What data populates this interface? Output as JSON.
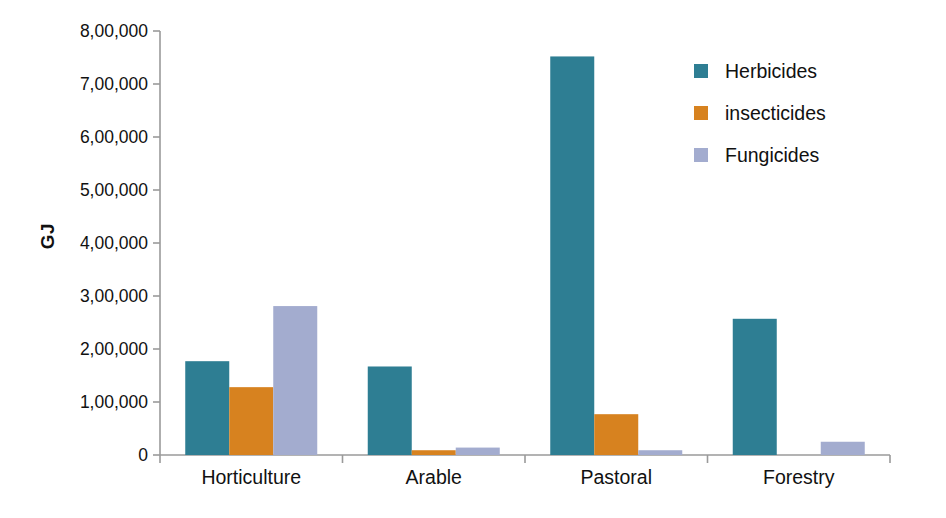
{
  "chart_data": {
    "type": "bar",
    "title": "",
    "xlabel": "",
    "ylabel": "GJ",
    "categories": [
      "Horticulture",
      "Arable",
      "Pastoral",
      "Forestry"
    ],
    "series": [
      {
        "name": "Herbicides",
        "color": "#2e7e93",
        "values": [
          177000,
          167000,
          752000,
          257000
        ]
      },
      {
        "name": "insecticides",
        "color": "#d7821f",
        "values": [
          128000,
          9000,
          77000,
          0
        ]
      },
      {
        "name": "Fungicides",
        "color": "#a3accf",
        "values": [
          281000,
          14000,
          9000,
          25000
        ]
      }
    ],
    "ylim": [
      0,
      800000
    ],
    "ytick_values": [
      0,
      100000,
      200000,
      300000,
      400000,
      500000,
      600000,
      700000,
      800000
    ],
    "ytick_labels": [
      "0",
      "1,00,000",
      "2,00,000",
      "3,00,000",
      "4,00,000",
      "5,00,000",
      "6,00,000",
      "7,00,000",
      "8,00,000"
    ],
    "grid": false,
    "legend_position": "right-top",
    "axis_color": "#9a9a9a",
    "background": "#ffffff"
  },
  "legend": {
    "items": [
      {
        "label": "Herbicides"
      },
      {
        "label": "insecticides"
      },
      {
        "label": "Fungicides"
      }
    ]
  },
  "axes": {
    "y_title": "GJ"
  }
}
